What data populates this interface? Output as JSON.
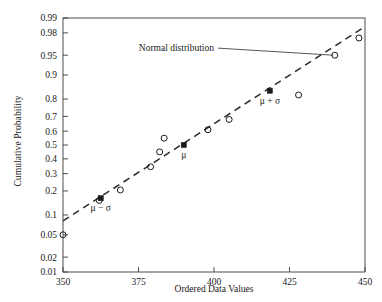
{
  "chart_data": {
    "type": "scatter",
    "title": "",
    "xlabel": "Ordered Data Values",
    "ylabel": "Cumulative Probability",
    "xlim": [
      350,
      450
    ],
    "xticks": [
      350,
      375,
      400,
      425,
      450
    ],
    "xticklabels": [
      "350",
      "375",
      "400",
      "425",
      "450"
    ],
    "yscale": "normal-probability",
    "ylim": [
      0.01,
      0.99
    ],
    "yticks": [
      0.01,
      0.02,
      0.05,
      0.1,
      0.2,
      0.3,
      0.4,
      0.5,
      0.6,
      0.7,
      0.8,
      0.9,
      0.95,
      0.98,
      0.99
    ],
    "yticklabels": [
      "0.01",
      "0.02",
      "0.05",
      "0.1",
      "0.2",
      "0.3",
      "0.4",
      "0.5",
      "0.6",
      "0.7",
      "0.8",
      "0.9",
      "0.95",
      "0.98",
      "0.99"
    ],
    "grid": false,
    "legend": null,
    "series": [
      {
        "name": "Ordered data",
        "marker": "open-circle",
        "points": [
          {
            "x": 350.0,
            "y": 0.05
          },
          {
            "x": 362.0,
            "y": 0.155
          },
          {
            "x": 369.0,
            "y": 0.205
          },
          {
            "x": 379.0,
            "y": 0.345
          },
          {
            "x": 382.0,
            "y": 0.45
          },
          {
            "x": 383.5,
            "y": 0.55
          },
          {
            "x": 398.0,
            "y": 0.61
          },
          {
            "x": 405.0,
            "y": 0.68
          },
          {
            "x": 428.0,
            "y": 0.82
          },
          {
            "x": 440.0,
            "y": 0.95
          },
          {
            "x": 448.0,
            "y": 0.975
          }
        ]
      },
      {
        "name": "Distribution parameters",
        "marker": "filled-square",
        "points": [
          {
            "x": 362.5,
            "y": 0.165,
            "label": "μ − σ"
          },
          {
            "x": 390.0,
            "y": 0.5,
            "label": "μ"
          },
          {
            "x": 418.5,
            "y": 0.84,
            "label": "μ + σ"
          }
        ]
      }
    ],
    "reference_line": {
      "name": "Normal distribution",
      "style": "dashed",
      "x_start": 350.0,
      "y_start": 0.082,
      "x_end": 450.0,
      "y_end": 0.985
    },
    "annotations": [
      {
        "text": "Normal distribution",
        "text_x": 400,
        "text_y": 0.962,
        "leader_to_x": 439.5,
        "leader_to_y": 0.95
      }
    ]
  },
  "style": {
    "axis_color": "#3a3a3a",
    "marker_color": "#1a1a1a",
    "line_color": "#2b2b2b",
    "text_color": "#1a1a1a",
    "background": "#ffffff"
  }
}
